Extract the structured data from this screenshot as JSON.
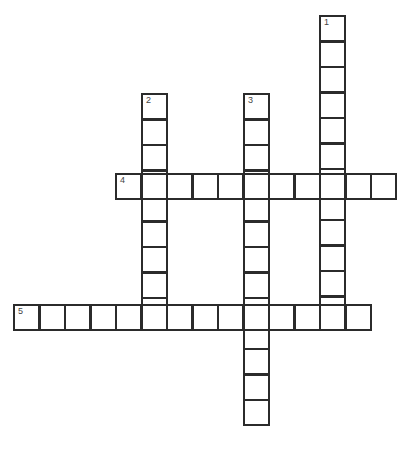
{
  "puzzle": {
    "cell_size": 25.5,
    "line_color": "#2b2b2b",
    "entries": [
      {
        "number": "1",
        "direction": "down",
        "x": 319,
        "y": 15,
        "length": 12
      },
      {
        "number": "2",
        "direction": "down",
        "x": 141,
        "y": 93,
        "length": 9
      },
      {
        "number": "3",
        "direction": "down",
        "x": 243,
        "y": 93,
        "length": 13
      },
      {
        "number": "4",
        "direction": "across",
        "x": 115,
        "y": 173,
        "length": 11
      },
      {
        "number": "5",
        "direction": "across",
        "x": 13,
        "y": 304,
        "length": 14
      }
    ]
  }
}
